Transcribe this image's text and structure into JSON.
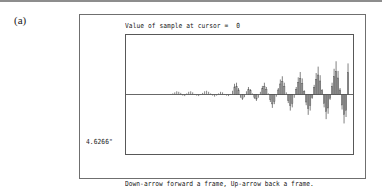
{
  "figure": {
    "part_label": "(a)"
  },
  "screen": {
    "status": {
      "label": "Value of sample at cursor =",
      "value": "0"
    },
    "scale_label": "4.6266\"",
    "help": [
      "Down-arrow forward a frame, Up-arrow back a frame.",
      "Right and left-arrows for cursor  movement; <ESC> for exit"
    ]
  },
  "colors": {
    "ink": "#171717",
    "frame": "#6f6f6f",
    "plot_border": "#585858",
    "trace": "#555555",
    "page": "#ffffff"
  },
  "chart_data": {
    "type": "bar",
    "title": "",
    "xlabel": "",
    "ylabel": "",
    "grid": false,
    "legend": null,
    "baseline": 0,
    "ylim": [
      -1.0,
      1.0
    ],
    "xlim": [
      0,
      110
    ],
    "x": [
      0,
      1,
      2,
      3,
      4,
      5,
      6,
      7,
      8,
      9,
      10,
      11,
      12,
      13,
      14,
      15,
      16,
      17,
      18,
      19,
      20,
      21,
      22,
      23,
      24,
      25,
      26,
      27,
      28,
      29,
      30,
      31,
      32,
      33,
      34,
      35,
      36,
      37,
      38,
      39,
      40,
      41,
      42,
      43,
      44,
      45,
      46,
      47,
      48,
      49,
      50,
      51,
      52,
      53,
      54,
      55,
      56,
      57,
      58,
      59,
      60,
      61,
      62,
      63,
      64,
      65,
      66,
      67,
      68,
      69,
      70,
      71,
      72,
      73,
      74,
      75,
      76,
      77,
      78,
      79,
      80,
      81,
      82,
      83,
      84,
      85,
      86,
      87,
      88,
      89,
      90,
      91,
      92,
      93,
      94,
      95,
      96,
      97,
      98,
      99,
      100,
      101,
      102,
      103,
      104,
      105,
      106,
      107,
      108,
      109
    ],
    "values": [
      0.0,
      0.0,
      0.0,
      0.0,
      0.0,
      0.0,
      0.0,
      0.0,
      0.0,
      0.0,
      0.0,
      0.0,
      0.0,
      0.0,
      0.0,
      0.0,
      0.0,
      0.0,
      0.0,
      0.0,
      0.01,
      0.02,
      0.04,
      0.06,
      0.05,
      0.03,
      -0.02,
      -0.03,
      0.02,
      0.05,
      0.06,
      0.04,
      0.01,
      -0.02,
      -0.03,
      -0.01,
      0.03,
      0.06,
      0.07,
      0.05,
      0.02,
      -0.02,
      -0.04,
      -0.02,
      0.02,
      0.05,
      0.04,
      0.01,
      -0.02,
      -0.03,
      0.01,
      0.07,
      0.2,
      0.22,
      0.12,
      -0.06,
      -0.1,
      -0.05,
      0.06,
      0.14,
      0.1,
      0.02,
      -0.08,
      -0.12,
      -0.06,
      0.05,
      0.16,
      0.22,
      0.14,
      0.02,
      -0.14,
      -0.25,
      -0.18,
      -0.04,
      0.12,
      0.28,
      0.34,
      0.22,
      0.04,
      -0.16,
      -0.3,
      -0.24,
      -0.06,
      0.14,
      0.32,
      0.42,
      0.3,
      0.08,
      -0.2,
      -0.38,
      -0.3,
      -0.08,
      0.18,
      0.4,
      0.52,
      0.36,
      0.1,
      -0.24,
      -0.46,
      -0.36,
      -0.1,
      0.22,
      0.48,
      0.62,
      0.44,
      0.12,
      -0.28,
      -0.54,
      -0.42,
      0.58
    ]
  }
}
